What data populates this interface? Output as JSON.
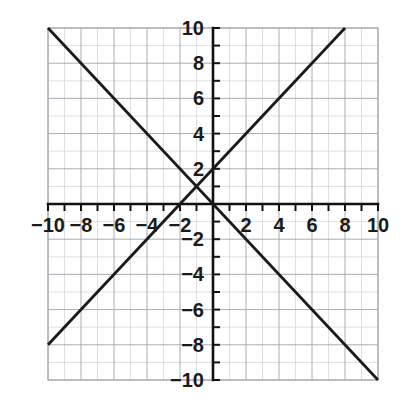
{
  "chart_data": {
    "type": "line",
    "title": "",
    "subtitle": "",
    "xlabel": "",
    "ylabel": "",
    "xlim": [
      -10,
      10
    ],
    "ylim": [
      -10,
      10
    ],
    "grid": true,
    "grid_minor_step": 1,
    "grid_major_step": 2,
    "legend": "none",
    "axes": {
      "x_ticks": [
        -10,
        -8,
        -6,
        -4,
        -2,
        2,
        4,
        6,
        8,
        10
      ],
      "y_ticks": [
        10,
        8,
        6,
        4,
        2,
        -2,
        -4,
        -6,
        -8,
        -10
      ],
      "x_tick_labels": [
        "−10",
        "−8",
        "−6",
        "−4",
        "−2",
        "2",
        "4",
        "6",
        "8",
        "10"
      ],
      "y_tick_labels": [
        "10",
        "8",
        "6",
        "4",
        "2",
        "−2",
        "−4",
        "−6",
        "−8",
        "−10"
      ],
      "tick_step": 1,
      "zero_label_shown": false
    },
    "series": [
      {
        "name": "line-rising",
        "equation": "y = x + 2",
        "slope": 1,
        "intercept": 2,
        "color": "#1a1a1a",
        "x": [
          -10,
          8
        ],
        "values": [
          -8,
          10
        ],
        "endpoints": [
          [
            -10,
            -8
          ],
          [
            8,
            10
          ]
        ]
      },
      {
        "name": "line-falling",
        "equation": "y = -x",
        "slope": -1,
        "intercept": 0,
        "color": "#1a1a1a",
        "x": [
          -10,
          10
        ],
        "values": [
          10,
          -10
        ],
        "endpoints": [
          [
            -10,
            10
          ],
          [
            10,
            -10
          ]
        ]
      }
    ],
    "annotations": [
      {
        "name": "intersection",
        "x": -1,
        "y": 1,
        "label": ""
      }
    ]
  },
  "colors": {
    "background": "#ffffff",
    "axis": "#111111",
    "grid_minor": "#d5d7dc",
    "grid_major": "#a9acb3",
    "plot_line": "#1a1a1a",
    "tick_label": "#1a1a1a"
  },
  "geometry": {
    "plot_left": 48,
    "plot_top": 28,
    "plot_right": 378,
    "plot_bottom": 380,
    "origin_x": 213,
    "origin_y": 204,
    "unit_x": 16.5,
    "unit_y": 17.6
  }
}
